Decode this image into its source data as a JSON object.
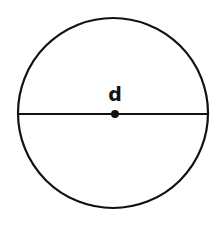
{
  "diagram": {
    "label": "d",
    "colors": {
      "stroke": "#111111",
      "background": "#ffffff"
    },
    "circle": {
      "cx": 113,
      "cy": 113,
      "r": 95
    },
    "diameter": {
      "x1": 19,
      "y1": 114,
      "x2": 208,
      "y2": 114
    },
    "center_point": {
      "cx": 115,
      "cy": 114,
      "r": 4
    }
  }
}
